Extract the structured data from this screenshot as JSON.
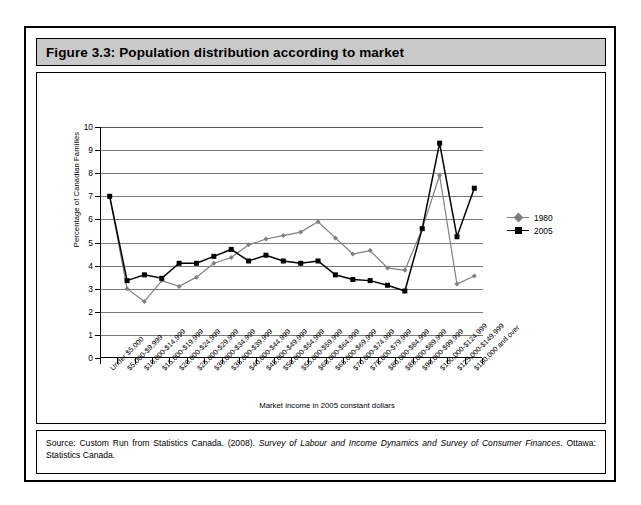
{
  "figure": {
    "title": "Figure 3.3: Population distribution according to market",
    "source_prefix": "Source: Custom Run from Statistics Canada. (2008). ",
    "source_italic": "Survey of Labour and Income Dynamics and Survey of Consumer Finances",
    "source_suffix": ". Ottawa: Statistics Canada."
  },
  "chart_data": {
    "type": "line",
    "title": "Figure 3.3: Population distribution according to market",
    "xlabel": "Market income in 2005 constant dollars",
    "ylabel": "Percentage of Canadian Families",
    "ylim": [
      0,
      10
    ],
    "ytick_values": [
      0,
      1,
      2,
      3,
      4,
      5,
      6,
      7,
      8,
      9,
      10
    ],
    "ytick_labels": [
      "0",
      "1",
      "2",
      "3",
      "4",
      "5",
      "6",
      "7",
      "8",
      "9",
      "10"
    ],
    "grid": true,
    "legend_position": "right",
    "categories": [
      "Under $5,000",
      "$5,000-$9,999",
      "$10,000-$14,999",
      "$15,000-$19,999",
      "$20,000-$24,999",
      "$25,000-$29,999",
      "$30,000-$34,999",
      "$35,000-$39,999",
      "$40,000-$44,999",
      "$45,000-$49,999",
      "$50,000-$54,999",
      "$55,000-$59,999",
      "$60,000-$64,999",
      "$65,000-$69,999",
      "$70,000-$74,999",
      "$75,000-$79,999",
      "$80,000-$84,999",
      "$85,000-$89,999",
      "$90,000-$99,999",
      "$100,000-$124,999",
      "$125,000-$149,999",
      "$150,000 and over"
    ],
    "series": [
      {
        "name": "1980",
        "color": "#808080",
        "marker": "diamond",
        "values": [
          7.0,
          3.0,
          2.45,
          3.35,
          3.1,
          3.5,
          4.1,
          4.35,
          4.9,
          5.15,
          5.3,
          5.45,
          5.9,
          5.2,
          4.5,
          4.65,
          3.9,
          3.8,
          5.6,
          7.9,
          3.2,
          3.55
        ]
      },
      {
        "name": "2005",
        "color": "#000000",
        "marker": "square",
        "values": [
          7.0,
          3.35,
          3.6,
          3.45,
          4.1,
          4.1,
          4.4,
          4.7,
          4.2,
          4.45,
          4.2,
          4.1,
          4.2,
          3.6,
          3.4,
          3.35,
          3.15,
          2.9,
          5.6,
          9.3,
          5.25,
          7.35
        ]
      }
    ]
  }
}
